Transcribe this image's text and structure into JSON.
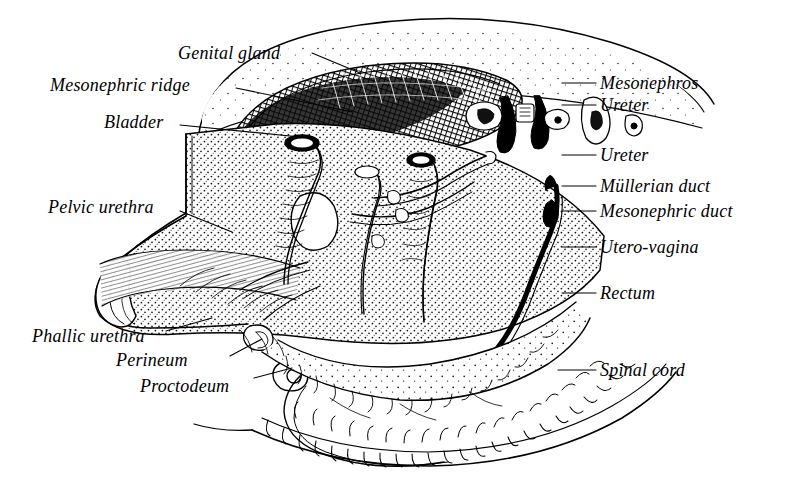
{
  "figure": {
    "style": "stippled line engraving, black ink on white",
    "background_color": "#ffffff",
    "ink_color": "#000000",
    "width": 792,
    "height": 487
  },
  "labels_left": [
    {
      "id": "genital-gland",
      "text": "Genital gland",
      "x": 178,
      "y": 44,
      "leader": {
        "x1": 312,
        "y1": 53,
        "x2": 360,
        "y2": 73
      }
    },
    {
      "id": "mesonephric-ridge",
      "text": "Mesonephric ridge",
      "x": 50,
      "y": 76,
      "leader": {
        "x1": 236,
        "y1": 88,
        "x2": 352,
        "y2": 112
      }
    },
    {
      "id": "bladder",
      "text": "Bladder",
      "x": 104,
      "y": 113,
      "leader": {
        "x1": 180,
        "y1": 125,
        "x2": 300,
        "y2": 137
      }
    },
    {
      "id": "pelvic-urethra",
      "text": "Pelvic urethra",
      "x": 48,
      "y": 198,
      "leader": {
        "x1": 180,
        "y1": 211,
        "x2": 232,
        "y2": 232
      }
    },
    {
      "id": "phallic-urethra",
      "text": "Phallic urethra",
      "x": 32,
      "y": 327,
      "leader": {
        "x1": 166,
        "y1": 331,
        "x2": 212,
        "y2": 318
      }
    },
    {
      "id": "perineum",
      "text": "Perineum",
      "x": 116,
      "y": 351,
      "leader": {
        "x1": 230,
        "y1": 356,
        "x2": 262,
        "y2": 339
      }
    },
    {
      "id": "proctodeum",
      "text": "Proctodeum",
      "x": 140,
      "y": 377,
      "leader": {
        "x1": 254,
        "y1": 378,
        "x2": 292,
        "y2": 368
      }
    }
  ],
  "labels_right": [
    {
      "id": "mesonephros",
      "text": "Mesonephros",
      "x": 600,
      "y": 74,
      "leader": {
        "x1": 562,
        "y1": 83,
        "x2": 596,
        "y2": 83
      }
    },
    {
      "id": "ureter-upper",
      "text": "Ureter",
      "x": 600,
      "y": 96,
      "leader": {
        "x1": 562,
        "y1": 105,
        "x2": 596,
        "y2": 105
      }
    },
    {
      "id": "ureter-lower",
      "text": "Ureter",
      "x": 600,
      "y": 146,
      "leader": {
        "x1": 562,
        "y1": 155,
        "x2": 596,
        "y2": 155
      }
    },
    {
      "id": "mullerian-duct",
      "text": "Müllerian duct",
      "x": 600,
      "y": 177,
      "leader": {
        "x1": 562,
        "y1": 186,
        "x2": 596,
        "y2": 186
      }
    },
    {
      "id": "mesonephric-duct",
      "text": "Mesonephric duct",
      "x": 600,
      "y": 202,
      "leader": {
        "x1": 562,
        "y1": 211,
        "x2": 596,
        "y2": 211
      }
    },
    {
      "id": "utero-vagina",
      "text": "Utero-vagina",
      "x": 600,
      "y": 238,
      "leader": {
        "x1": 562,
        "y1": 247,
        "x2": 596,
        "y2": 247
      }
    },
    {
      "id": "rectum",
      "text": "Rectum",
      "x": 600,
      "y": 284,
      "leader": {
        "x1": 562,
        "y1": 293,
        "x2": 596,
        "y2": 293
      }
    },
    {
      "id": "spinal-cord",
      "text": "Spinal cord",
      "x": 600,
      "y": 361,
      "leader": {
        "x1": 558,
        "y1": 370,
        "x2": 596,
        "y2": 370
      }
    }
  ]
}
